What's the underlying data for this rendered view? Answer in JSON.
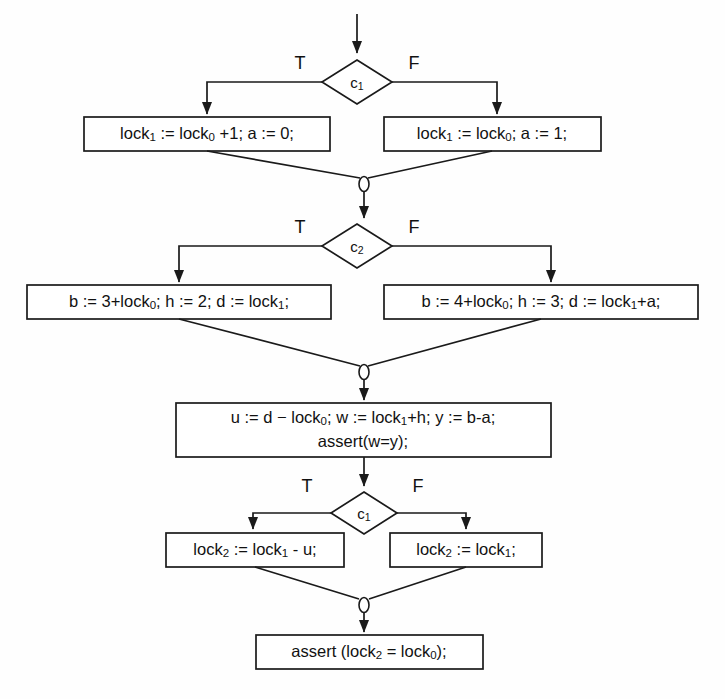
{
  "diagram": {
    "colors": {
      "background": "#fefefe",
      "stroke": "#1a1a1a",
      "node_fill": "#ffffff",
      "text": "#111111"
    },
    "branch_labels": {
      "true": "T",
      "false": "F"
    },
    "entry": {
      "name": "entry-arrow"
    },
    "nodes": [
      {
        "id": "cond-1",
        "type": "decision",
        "label_base": "c",
        "label_sub": "1",
        "label_full": "c1"
      },
      {
        "id": "assign-lock1-inc",
        "type": "statement",
        "branch": "true",
        "lines": [
          [
            {
              "t": "lock",
              "s": "1"
            },
            {
              "t": " := lock",
              "s": "0"
            },
            {
              "t": " +1; a := 0;",
              "s": ""
            }
          ]
        ],
        "text": "lock1 := lock0 +1; a := 0;"
      },
      {
        "id": "assign-lock1-copy",
        "type": "statement",
        "branch": "false",
        "lines": [
          [
            {
              "t": "lock",
              "s": "1"
            },
            {
              "t": " := lock",
              "s": "0"
            },
            {
              "t": "; a := 1;",
              "s": ""
            }
          ]
        ],
        "text": "lock1 := lock0; a := 1;"
      },
      {
        "id": "merge-1",
        "type": "merge",
        "text": ""
      },
      {
        "id": "cond-2",
        "type": "decision",
        "label_base": "c",
        "label_sub": "2",
        "label_full": "c2"
      },
      {
        "id": "assign-b3",
        "type": "statement",
        "branch": "true",
        "lines": [
          [
            {
              "t": "b := 3+lock",
              "s": "0"
            },
            {
              "t": "; h := 2; d := lock",
              "s": "1"
            },
            {
              "t": ";",
              "s": ""
            }
          ]
        ],
        "text": "b := 3+lock0; h := 2; d := lock1;"
      },
      {
        "id": "assign-b4",
        "type": "statement",
        "branch": "false",
        "lines": [
          [
            {
              "t": "b := 4+lock",
              "s": "0"
            },
            {
              "t": "; h := 3; d := lock",
              "s": "1"
            },
            {
              "t": "+a;",
              "s": ""
            }
          ]
        ],
        "text": "b := 4+lock0; h := 3; d := lock1+a;"
      },
      {
        "id": "merge-2",
        "type": "merge",
        "text": ""
      },
      {
        "id": "assign-u-w-y",
        "type": "statement",
        "lines": [
          [
            {
              "t": "u := d ",
              "s": ""
            },
            {
              "t": "− lock",
              "s": "0"
            },
            {
              "t": "; w := lock",
              "s": "1"
            },
            {
              "t": "+h; y := b-a;",
              "s": ""
            }
          ],
          [
            {
              "t": "assert(w=y);",
              "s": ""
            }
          ]
        ],
        "text_line1": "u := d − lock0; w := lock1+h; y := b-a;",
        "text_line2": "assert(w=y);"
      },
      {
        "id": "cond-3",
        "type": "decision",
        "label_base": "c",
        "label_sub": "1",
        "label_full": "c1"
      },
      {
        "id": "assign-lock2-minus",
        "type": "statement",
        "branch": "true",
        "lines": [
          [
            {
              "t": "lock",
              "s": "2"
            },
            {
              "t": " := lock",
              "s": "1"
            },
            {
              "t": " - u;",
              "s": ""
            }
          ]
        ],
        "text": "lock2 := lock1 - u;"
      },
      {
        "id": "assign-lock2-copy",
        "type": "statement",
        "branch": "false",
        "lines": [
          [
            {
              "t": "lock",
              "s": "2"
            },
            {
              "t": " := lock",
              "s": "1"
            },
            {
              "t": ";",
              "s": ""
            }
          ]
        ],
        "text": "lock2 := lock1;"
      },
      {
        "id": "merge-3",
        "type": "merge",
        "text": ""
      },
      {
        "id": "assert-final",
        "type": "statement",
        "lines": [
          [
            {
              "t": "assert (lock",
              "s": "2"
            },
            {
              "t": " = lock",
              "s": "0"
            },
            {
              "t": ");",
              "s": ""
            }
          ]
        ],
        "text": "assert (lock2 = lock0);"
      }
    ]
  },
  "labels": {
    "t1": "T",
    "f1": "F",
    "t2": "T",
    "f2": "F",
    "t3": "T",
    "f3": "F",
    "c1_base": "c",
    "c1_sub": "1",
    "c2_base": "c",
    "c2_sub": "2",
    "c3_base": "c",
    "c3_sub": "1",
    "box1_a": "lock",
    "box1_a_sub": "1",
    "box1_b": " := lock",
    "box1_b_sub": "0",
    "box1_c": " +1; a := 0;",
    "box2_a": "lock",
    "box2_a_sub": "1",
    "box2_b": " := lock",
    "box2_b_sub": "0",
    "box2_c": "; a := 1;",
    "box3_a": "b := 3+lock",
    "box3_a_sub": "0",
    "box3_b": "; h := 2; d := lock",
    "box3_b_sub": "1",
    "box3_c": ";",
    "box4_a": "b := 4+lock",
    "box4_a_sub": "0",
    "box4_b": "; h := 3; d := lock",
    "box4_b_sub": "1",
    "box4_c": "+a;",
    "box5_a": "u := d − lock",
    "box5_a_sub": "0",
    "box5_b": "; w := lock",
    "box5_b_sub": "1",
    "box5_c": "+h; y := b-a;",
    "box5_line2": "assert(w=y);",
    "box6_a": "lock",
    "box6_a_sub": "2",
    "box6_b": " := lock",
    "box6_b_sub": "1",
    "box6_c": " - u;",
    "box7_a": "lock",
    "box7_a_sub": "2",
    "box7_b": " := lock",
    "box7_b_sub": "1",
    "box7_c": ";",
    "box8_a": "assert (lock",
    "box8_a_sub": "2",
    "box8_b": " = lock",
    "box8_b_sub": "0",
    "box8_c": ");"
  }
}
